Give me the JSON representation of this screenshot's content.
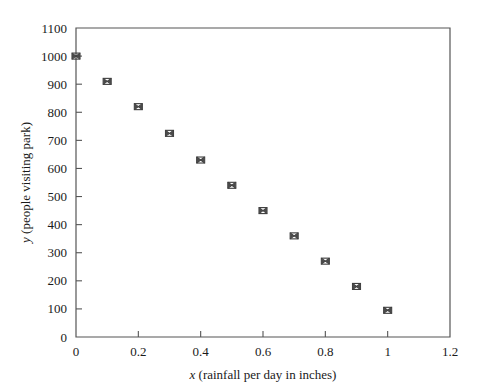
{
  "chart_data": {
    "type": "scatter",
    "title": "",
    "xlabel": "x (rainfall per day in inches)",
    "xlabel_var": "x",
    "xlabel_rest": " (rainfall per day in inches)",
    "ylabel": "y (people visiting park)",
    "ylabel_var": "y",
    "ylabel_rest": " (people visiting park)",
    "xlim": [
      0,
      1.2
    ],
    "ylim": [
      0,
      1100
    ],
    "grid": false,
    "legend": null,
    "x_ticks": [
      0,
      0.2,
      0.4,
      0.6,
      0.8,
      1,
      1.2
    ],
    "x_tick_labels": [
      "0",
      "0.2",
      "0.4",
      "0.6",
      "0.8",
      "1",
      "1.2"
    ],
    "y_ticks": [
      0,
      100,
      200,
      300,
      400,
      500,
      600,
      700,
      800,
      900,
      1000,
      1100
    ],
    "y_tick_labels": [
      "0",
      "100",
      "200",
      "300",
      "400",
      "500",
      "600",
      "700",
      "800",
      "900",
      "1000",
      "1100"
    ],
    "marker_style": "square-with-cross",
    "x": [
      0,
      0.1,
      0.2,
      0.3,
      0.4,
      0.5,
      0.6,
      0.7,
      0.8,
      0.9,
      1
    ],
    "y": [
      1000,
      910,
      820,
      725,
      630,
      540,
      450,
      360,
      270,
      180,
      95
    ],
    "points": [
      {
        "x": 0,
        "y": 1000
      },
      {
        "x": 0.1,
        "y": 910
      },
      {
        "x": 0.2,
        "y": 820
      },
      {
        "x": 0.3,
        "y": 725
      },
      {
        "x": 0.4,
        "y": 630
      },
      {
        "x": 0.5,
        "y": 540
      },
      {
        "x": 0.6,
        "y": 450
      },
      {
        "x": 0.7,
        "y": 360
      },
      {
        "x": 0.8,
        "y": 270
      },
      {
        "x": 0.9,
        "y": 180
      },
      {
        "x": 1,
        "y": 95
      }
    ],
    "colors": {
      "marker": "#4a4a4a",
      "axis": "#555555",
      "text": "#1a1a1a",
      "background": "#ffffff"
    }
  }
}
